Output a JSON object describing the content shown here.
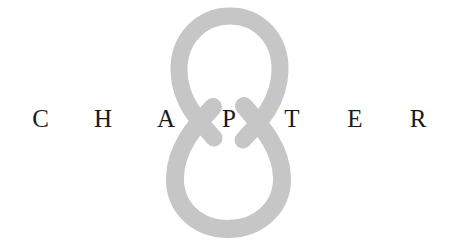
{
  "page": {
    "kind": "book-chapter-opener",
    "width": 459,
    "height": 247,
    "background_color": "#ffffff"
  },
  "chapter_numeral": {
    "value": "8",
    "icon_name": "numeral-eight-ornament",
    "color": "#c6c6c6",
    "style": "didone-script-open-loops",
    "description": "Large light gray figure-eight formed by two teardrop loops that cross in an X at the vertical center"
  },
  "chapter_word": {
    "text": "CHAPTER",
    "color": "#1a1a1a",
    "letters": [
      {
        "char": "C"
      },
      {
        "char": "H"
      },
      {
        "char": "A"
      },
      {
        "char": "P"
      },
      {
        "char": "T"
      },
      {
        "char": "E"
      },
      {
        "char": "R"
      }
    ]
  }
}
